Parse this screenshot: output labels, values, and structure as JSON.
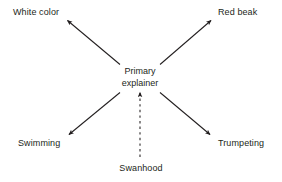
{
  "diagram": {
    "type": "radial-explanation-diagram",
    "background_color": "#ffffff",
    "stroke_color": "#231f20",
    "text_color": "#231f20",
    "center_node": {
      "line1": "Primary",
      "line2": "explainer",
      "full_text": "Primary explainer"
    },
    "outer_nodes": [
      {
        "id": "white-color",
        "label": "White color",
        "position": "top-left"
      },
      {
        "id": "red-beak",
        "label": "Red beak",
        "position": "top-right"
      },
      {
        "id": "swimming",
        "label": "Swimming",
        "position": "bottom-left"
      },
      {
        "id": "trumpeting",
        "label": "Trumpeting",
        "position": "bottom-right"
      }
    ],
    "source_node": {
      "id": "swanhood",
      "label": "Swanhood",
      "position": "bottom-center"
    },
    "edges": [
      {
        "from": "Primary explainer",
        "to": "White color",
        "style": "solid",
        "arrowhead": "end"
      },
      {
        "from": "Primary explainer",
        "to": "Red beak",
        "style": "solid",
        "arrowhead": "end"
      },
      {
        "from": "Primary explainer",
        "to": "Swimming",
        "style": "solid",
        "arrowhead": "end"
      },
      {
        "from": "Primary explainer",
        "to": "Trumpeting",
        "style": "solid",
        "arrowhead": "end"
      },
      {
        "from": "Swanhood",
        "to": "Primary explainer",
        "style": "dashed",
        "arrowhead": "end"
      }
    ]
  }
}
